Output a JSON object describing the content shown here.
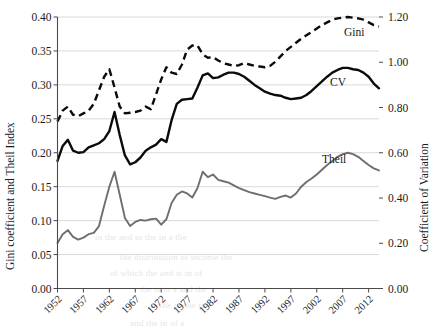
{
  "chart_data": {
    "type": "line",
    "title": "",
    "xlabel": "",
    "ylabel": "Gini coefficient and Theil Index",
    "y2label": "Coefficient of Variation",
    "grid": true,
    "legend": "inline-labels",
    "xlim": [
      1952,
      2014
    ],
    "ylim": [
      0.0,
      0.4
    ],
    "y2lim": [
      0.0,
      1.2
    ],
    "yticks": [
      "0.00",
      "0.05",
      "0.10",
      "0.15",
      "0.20",
      "0.25",
      "0.30",
      "0.35",
      "0.40"
    ],
    "y2ticks": [
      "0.00",
      "0.20",
      "0.40",
      "0.60",
      "0.80",
      "1.00",
      "1.20"
    ],
    "xticks": [
      "1952",
      "1957",
      "1962",
      "1967",
      "1972",
      "1977",
      "1982",
      "1987",
      "1992",
      "1997",
      "2002",
      "2007",
      "2012"
    ],
    "x": [
      1952,
      1953,
      1954,
      1955,
      1956,
      1957,
      1958,
      1959,
      1960,
      1961,
      1962,
      1963,
      1964,
      1965,
      1966,
      1967,
      1968,
      1969,
      1970,
      1971,
      1972,
      1973,
      1974,
      1975,
      1976,
      1977,
      1978,
      1979,
      1980,
      1981,
      1982,
      1983,
      1984,
      1985,
      1986,
      1987,
      1988,
      1989,
      1990,
      1991,
      1992,
      1993,
      1994,
      1995,
      1996,
      1997,
      1998,
      1999,
      2000,
      2001,
      2002,
      2003,
      2004,
      2005,
      2006,
      2007,
      2008,
      2009,
      2010,
      2011,
      2012,
      2013,
      2014
    ],
    "series": [
      {
        "name": "Gini",
        "axis": "left",
        "style": "dashed",
        "color": "#0b0b0b",
        "label_text": "Gini",
        "values": [
          0.246,
          0.262,
          0.268,
          0.256,
          0.254,
          0.258,
          0.262,
          0.272,
          0.292,
          0.312,
          0.323,
          0.296,
          0.268,
          0.258,
          0.259,
          0.26,
          0.262,
          0.268,
          0.264,
          0.286,
          0.308,
          0.326,
          0.318,
          0.316,
          0.33,
          0.352,
          0.358,
          0.358,
          0.345,
          0.34,
          0.341,
          0.336,
          0.332,
          0.33,
          0.328,
          0.329,
          0.332,
          0.33,
          0.328,
          0.327,
          0.326,
          0.328,
          0.334,
          0.342,
          0.35,
          0.356,
          0.362,
          0.368,
          0.373,
          0.378,
          0.383,
          0.388,
          0.392,
          0.396,
          0.398,
          0.399,
          0.4,
          0.399,
          0.398,
          0.396,
          0.392,
          0.388,
          0.386
        ]
      },
      {
        "name": "CV",
        "axis": "left",
        "style": "solid",
        "color": "#0b0b0b",
        "label_text": "CV",
        "values": [
          0.188,
          0.21,
          0.219,
          0.203,
          0.2,
          0.201,
          0.208,
          0.211,
          0.214,
          0.22,
          0.232,
          0.26,
          0.226,
          0.196,
          0.183,
          0.186,
          0.193,
          0.203,
          0.208,
          0.212,
          0.22,
          0.216,
          0.248,
          0.272,
          0.278,
          0.279,
          0.28,
          0.296,
          0.314,
          0.317,
          0.31,
          0.311,
          0.315,
          0.318,
          0.318,
          0.316,
          0.312,
          0.306,
          0.3,
          0.295,
          0.29,
          0.287,
          0.285,
          0.284,
          0.281,
          0.279,
          0.28,
          0.281,
          0.285,
          0.291,
          0.298,
          0.305,
          0.312,
          0.318,
          0.322,
          0.325,
          0.325,
          0.323,
          0.322,
          0.318,
          0.312,
          0.302,
          0.295
        ]
      },
      {
        "name": "Theil",
        "axis": "left",
        "style": "solid",
        "color": "#6e6e6e",
        "label_text": "Theil",
        "values": [
          0.067,
          0.08,
          0.086,
          0.076,
          0.072,
          0.075,
          0.08,
          0.082,
          0.092,
          0.122,
          0.15,
          0.172,
          0.138,
          0.104,
          0.092,
          0.098,
          0.101,
          0.1,
          0.102,
          0.103,
          0.094,
          0.102,
          0.126,
          0.138,
          0.143,
          0.14,
          0.134,
          0.148,
          0.172,
          0.164,
          0.168,
          0.16,
          0.158,
          0.156,
          0.152,
          0.148,
          0.145,
          0.142,
          0.14,
          0.138,
          0.136,
          0.134,
          0.132,
          0.135,
          0.137,
          0.134,
          0.14,
          0.15,
          0.157,
          0.162,
          0.168,
          0.175,
          0.182,
          0.188,
          0.194,
          0.198,
          0.2,
          0.198,
          0.194,
          0.188,
          0.182,
          0.177,
          0.174
        ]
      }
    ]
  },
  "ghost_lines": [
    {
      "text": "in the and  to  the  in a  the",
      "x": 95,
      "y": 232,
      "size": 9
    },
    {
      "text": "the distribution of income  the",
      "x": 120,
      "y": 252,
      "size": 9
    },
    {
      "text": "of which the  and  is  in  of",
      "x": 110,
      "y": 268,
      "size": 9
    },
    {
      "text": "the  is  in  a  and  the",
      "x": 140,
      "y": 284,
      "size": 9
    },
    {
      "text": "to  the of  the  in",
      "x": 150,
      "y": 300,
      "size": 9
    },
    {
      "text": "and  the  in  of  a",
      "x": 130,
      "y": 318,
      "size": 9
    }
  ]
}
